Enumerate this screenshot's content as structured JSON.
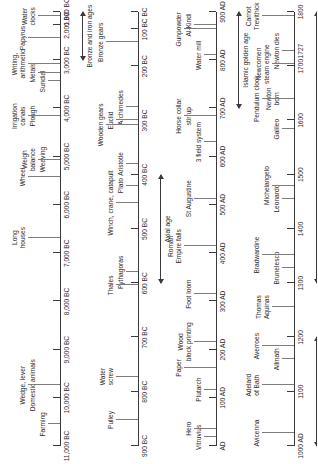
{
  "diagram": {
    "orientation": "rotated-90-ccw",
    "axis_color": "#3a3a3a",
    "leader_color": "#7d7d7d"
  },
  "rows": [
    {
      "id": "row-1",
      "ticks": [
        {
          "label": "11,000 BC",
          "pos": 0
        },
        {
          "label": "10,000 BC",
          "pos": 11.1
        },
        {
          "label": "9,000 BC",
          "pos": 22.2
        },
        {
          "label": "8,000 BC",
          "pos": 33.3
        },
        {
          "label": "7,000 BC",
          "pos": 44.4
        },
        {
          "label": "6,000 BC",
          "pos": 55.6
        },
        {
          "label": "5,000 BC",
          "pos": 66.7
        },
        {
          "label": "4,000 BC",
          "pos": 77.8
        },
        {
          "label": "3,000 BC",
          "pos": 88.9
        },
        {
          "label": "2,000 BC",
          "pos": 97.0
        },
        {
          "label": "1,000 BC",
          "pos": 100
        }
      ],
      "events": [
        {
          "text": "Farming",
          "pos": 5.0,
          "tier": 1
        },
        {
          "text": "Domestic animals",
          "pos": 14.0,
          "tier": 2
        },
        {
          "text": "Wedge, lever",
          "pos": 14.0,
          "tier": 3
        },
        {
          "text": "Long\nhouses",
          "pos": 48.0,
          "tier": 3
        },
        {
          "text": "Wheel",
          "pos": 62.0,
          "tier": 3
        },
        {
          "text": "Weaving",
          "pos": 66.0,
          "tier": 1
        },
        {
          "text": "Weigh\nbalance",
          "pos": 66.0,
          "tier": 2
        },
        {
          "text": "Plough",
          "pos": 76.0,
          "tier": 2
        },
        {
          "text": "Irrigation\ncanals",
          "pos": 76.0,
          "tier": 3
        },
        {
          "text": "Sundial",
          "pos": 84.0,
          "tier": 1
        },
        {
          "text": "Metals",
          "pos": 86.0,
          "tier": 2
        },
        {
          "text": "Writing,\narithmetic",
          "pos": 88.0,
          "tier": 3
        },
        {
          "text": "Papyrus",
          "pos": 94.0,
          "tier": 3
        },
        {
          "text": "Water\nclocks",
          "pos": 99.0,
          "tier": 2
        }
      ],
      "era": {
        "label": "Bronze and iron ages",
        "start": 88.9,
        "end": 100
      }
    },
    {
      "id": "row-2",
      "ticks": [
        {
          "label": "900 BC",
          "pos": 0
        },
        {
          "label": "800 BC",
          "pos": 12.5
        },
        {
          "label": "700 BC",
          "pos": 25.0
        },
        {
          "label": "600 BC",
          "pos": 37.5
        },
        {
          "label": "500 BC",
          "pos": 50.0
        },
        {
          "label": "400 BC",
          "pos": 62.5
        },
        {
          "label": "300 BC",
          "pos": 75.0
        },
        {
          "label": "200 BC",
          "pos": 87.5
        },
        {
          "label": "100 BC",
          "pos": 96.0
        },
        {
          "label": "BC",
          "pos": 100
        }
      ],
      "events": [
        {
          "text": "Pulley",
          "pos": 6.0,
          "tier": 2
        },
        {
          "text": "Water\nscrew",
          "pos": 16.0,
          "tier": 2
        },
        {
          "text": "Pythagoras",
          "pos": 40.0,
          "tier": 1
        },
        {
          "text": "Thales",
          "pos": 37.0,
          "tier": 2
        },
        {
          "text": "Plato",
          "pos": 60.0,
          "tier": 1
        },
        {
          "text": "Aristotle",
          "pos": 65.0,
          "tier": 1
        },
        {
          "text": "Winch, crane, catapult",
          "pos": 56.0,
          "tier": 2
        },
        {
          "text": "Archimedes",
          "pos": 78.0,
          "tier": 1
        },
        {
          "text": "Euclid",
          "pos": 75.0,
          "tier": 2
        },
        {
          "text": "Wooden gears",
          "pos": 74.0,
          "tier": 3
        },
        {
          "text": "Bronze gears",
          "pos": 93.0,
          "tier": 3
        }
      ],
      "era": {
        "label": "Axial age",
        "start": 37.5,
        "end": 62.5
      }
    },
    {
      "id": "row-3",
      "ticks": [
        {
          "label": "AD",
          "pos": 0
        },
        {
          "label": "100 AD",
          "pos": 11.1
        },
        {
          "label": "200 AD",
          "pos": 22.2
        },
        {
          "label": "300 AD",
          "pos": 33.3
        },
        {
          "label": "400 AD",
          "pos": 44.4
        },
        {
          "label": "500 AD",
          "pos": 55.6
        },
        {
          "label": "600 AD",
          "pos": 66.7
        },
        {
          "label": "700 AD",
          "pos": 77.8
        },
        {
          "label": "800 AD",
          "pos": 88.9
        },
        {
          "label": "900 AD",
          "pos": 100
        }
      ],
      "events": [
        {
          "text": "Vitruvius",
          "pos": 2.0,
          "tier": 1
        },
        {
          "text": "Hero",
          "pos": 4.0,
          "tier": 2
        },
        {
          "text": "Plutarch",
          "pos": 13.0,
          "tier": 1
        },
        {
          "text": "Paper",
          "pos": 18.0,
          "tier": 3
        },
        {
          "text": "Wood\nblock printing",
          "pos": 24.0,
          "tier": 2
        },
        {
          "text": "Foot loom",
          "pos": 35.0,
          "tier": 2
        },
        {
          "text": "Roman\nEmpire falls",
          "pos": 46.0,
          "tier": 3
        },
        {
          "text": "St Augustine",
          "pos": 57.0,
          "tier": 2
        },
        {
          "text": "3 field system",
          "pos": 70.0,
          "tier": 1
        },
        {
          "text": "stirrup",
          "pos": 76.0,
          "tier": 2
        },
        {
          "text": "Horse collar",
          "pos": 76.0,
          "tier": 3
        },
        {
          "text": "Water mill",
          "pos": 90.0,
          "tier": 1
        },
        {
          "text": "Al-Kindi",
          "pos": 97.0,
          "tier": 2
        },
        {
          "text": "Gunpowder",
          "pos": 96.0,
          "tier": 3
        }
      ],
      "era": {
        "label": "Islamic golden age",
        "start": 77.8,
        "end": 100
      }
    },
    {
      "id": "row-4",
      "ticks": [
        {
          "label": "1000 AD",
          "pos": 0
        },
        {
          "label": "1100",
          "pos": 12.5
        },
        {
          "label": "1200",
          "pos": 25.0
        },
        {
          "label": "1300",
          "pos": 37.5
        },
        {
          "label": "1400",
          "pos": 50.0
        },
        {
          "label": "1500",
          "pos": 62.5
        },
        {
          "label": "1600",
          "pos": 75.0
        },
        {
          "label": "1700",
          "pos": 87.5
        },
        {
          "label": "1727",
          "pos": 91.0
        },
        {
          "label": "1800",
          "pos": 100
        }
      ],
      "events": [
        {
          "text": "Avicenna",
          "pos": 3.0,
          "tier": 3
        },
        {
          "text": "Adelard\nof Bath",
          "pos": 14.0,
          "tier": 3
        },
        {
          "text": "Allmath",
          "pos": 20.0,
          "tier": 1
        },
        {
          "text": "Averroes",
          "pos": 23.0,
          "tier": 3
        },
        {
          "text": "Thomas\nAquinas",
          "pos": 32.0,
          "tier": 2
        },
        {
          "text": "Brunelesco",
          "pos": 41.0,
          "tier": 1
        },
        {
          "text": "Bradwardine",
          "pos": 44.0,
          "tier": 3
        },
        {
          "text": "Leonardo",
          "pos": 57.0,
          "tier": 1
        },
        {
          "text": "Michelangelo",
          "pos": 60.0,
          "tier": 2
        },
        {
          "text": "Galileo",
          "pos": 73.0,
          "tier": 1
        },
        {
          "text": "Newton\nborn",
          "pos": 80.0,
          "tier": 1
        },
        {
          "text": "Pendulum clock",
          "pos": 80.0,
          "tier": 3
        },
        {
          "text": "Newton dies",
          "pos": 91.0,
          "tier": 1
        },
        {
          "text": "Newcomen\nsteam engine",
          "pos": 88.0,
          "tier": 2
        },
        {
          "text": "Carnot\nTrevithick",
          "pos": 99.0,
          "tier": 3
        }
      ],
      "era": {
        "label": "Renaissance",
        "start": 37.5,
        "end": 100
      },
      "era2": {
        "label": "Islamic golden age",
        "start": 0,
        "end": 25.0
      }
    }
  ]
}
